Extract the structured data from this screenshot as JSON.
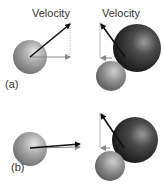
{
  "panels": [
    {
      "id": "a",
      "label": "(a)",
      "velocity_label_left": "Velocity",
      "velocity_label_right": "Velocity"
    },
    {
      "id": "b",
      "label": "(b)"
    }
  ],
  "colors": {
    "arrow": "#111111",
    "component_arrow": "#888888",
    "sphere_light": "#9a9a9a",
    "sphere_dark": "#1c1c1c"
  }
}
